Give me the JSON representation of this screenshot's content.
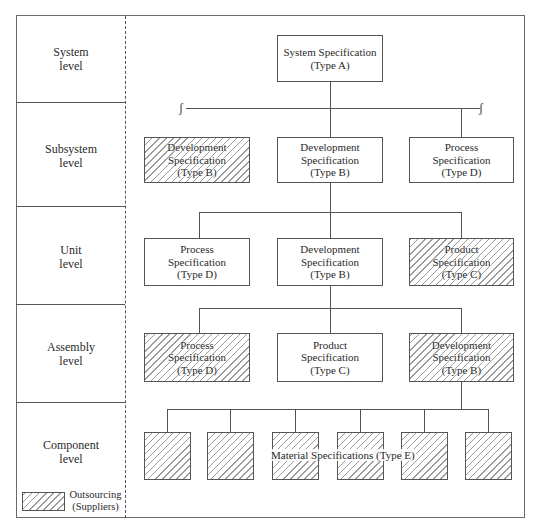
{
  "levels": [
    {
      "label": "System\nlevel"
    },
    {
      "label": "Subsystem\nlevel"
    },
    {
      "label": "Unit\nlevel"
    },
    {
      "label": "Assembly\nlevel"
    },
    {
      "label": "Component\nlevel"
    }
  ],
  "system": {
    "box": {
      "text": "System Specification\n(Type A)",
      "outsourced": false
    }
  },
  "subsystem": [
    {
      "text": "Development\nSpecification\n(Type B)",
      "outsourced": true
    },
    {
      "text": "Development\nSpecification\n(Type B)",
      "outsourced": false
    },
    {
      "text": "Process\nSpecification\n(Type D)",
      "outsourced": false
    }
  ],
  "unit": [
    {
      "text": "Process\nSpecification\n(Type D)",
      "outsourced": false
    },
    {
      "text": "Development\nSpecification\n(Type B)",
      "outsourced": false
    },
    {
      "text": "Product\nSpecification\n(Type C)",
      "outsourced": true
    }
  ],
  "assembly": [
    {
      "text": "Process\nSpecification\n(Type D)",
      "outsourced": true
    },
    {
      "text": "Product\nSpecification\n(Type C)",
      "outsourced": false
    },
    {
      "text": "Development\nSpecification\n(Type B)",
      "outsourced": true
    }
  ],
  "component": {
    "label": "Material Specifications (Type E)",
    "count": 6,
    "outsourced": true
  },
  "break_symbol": "ʃ",
  "legend": {
    "text": "Outsourcing\n(Suppliers)"
  },
  "colors": {
    "line": "#555555",
    "hatch": "#9a9a9a",
    "background": "#ffffff"
  }
}
